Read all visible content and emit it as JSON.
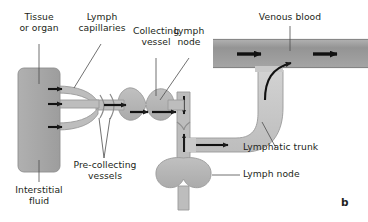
{
  "figure": {
    "panel_letter": "b",
    "title_implied": "Lymphatic drainage pathway from tissue to venous blood"
  },
  "labels": {
    "tissue_or_organ": "Tissue\nor organ",
    "lymph_capillaries": "Lymph\ncapillaries",
    "collecting_vessel": "Collecting\nvessel",
    "lymph_node_top": "Lymph\nnode",
    "venous_blood": "Venous blood",
    "lymphatic_trunk": "Lymphatic trunk",
    "lymph_node_right": "Lymph node",
    "pre_collecting_vessels": "Pre-collecting\nvessels",
    "interstitial_fluid": "Interstitial\nfluid"
  },
  "colors": {
    "venous_blood_fill": "#9a9a9a",
    "tissue_fill": "#a8a8a8",
    "vessel_fill": "#bdbdbd",
    "lymph_node_fill": "#b5b5b5",
    "trunk_fill": "#c9c9c9",
    "outline": "#8c8c8c",
    "arrow": "#1a1a1a",
    "text": "#231f20",
    "leader_line": "#4d4d4d",
    "background": "#ffffff"
  },
  "elements": {
    "tissue_block": {
      "name": "Tissue or organ",
      "shape": "rounded-rectangle"
    },
    "capillaries_count": 3,
    "lymph_nodes_count": 2,
    "venous_blood_arrows": 2,
    "flow_arrows": 8
  }
}
